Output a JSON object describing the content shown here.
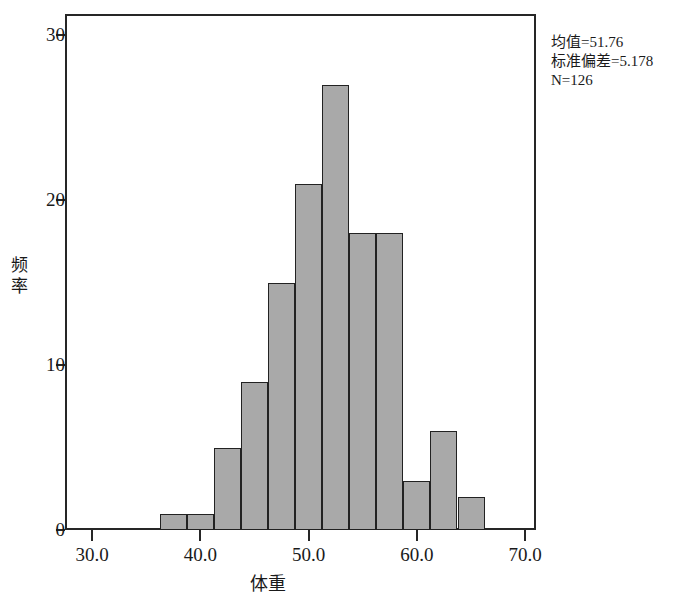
{
  "chart_data": {
    "type": "bar",
    "title": "",
    "subtitle": "",
    "xlabel": "体重",
    "ylabel": "频率",
    "grid": false,
    "legend": null,
    "xlim": [
      27.5,
      71.0
    ],
    "ylim": [
      0,
      31.3
    ],
    "bin_width": 2.5,
    "x_ticks": [
      "30.0",
      "40.0",
      "50.0",
      "60.0",
      "70.0"
    ],
    "x_tick_values": [
      30.0,
      40.0,
      50.0,
      60.0,
      70.0
    ],
    "y_ticks": [
      "0",
      "10",
      "20",
      "30"
    ],
    "y_tick_values": [
      0,
      10,
      20,
      30
    ],
    "categories": [
      "36.25-38.75",
      "38.75-41.25",
      "41.25-43.75",
      "43.75-46.25",
      "46.25-48.75",
      "48.75-51.25",
      "51.25-53.75",
      "53.75-56.25",
      "56.25-58.75",
      "58.75-61.25",
      "61.25-63.75",
      "63.75-66.25"
    ],
    "bin_starts": [
      36.25,
      38.75,
      41.25,
      43.75,
      46.25,
      48.75,
      51.25,
      53.75,
      56.25,
      58.75,
      61.25,
      63.75
    ],
    "values": [
      1,
      1,
      5,
      9,
      15,
      21,
      27,
      18,
      18,
      3,
      6,
      2
    ],
    "bar_color": "#a9a9a9",
    "bar_edge_color": "#222222",
    "axis_color": "#262626",
    "background": "#ffffff",
    "annotations": [
      "均值=51.76",
      "标准偏差=5.178",
      "N=126"
    ]
  },
  "stats": {
    "mean_label": "均值=51.76",
    "stddev_label": "标准偏差=5.178",
    "n_label": "N=126"
  },
  "axes": {
    "y_title_char_1": "频",
    "y_title_char_2": "率",
    "x_title": "体重"
  }
}
